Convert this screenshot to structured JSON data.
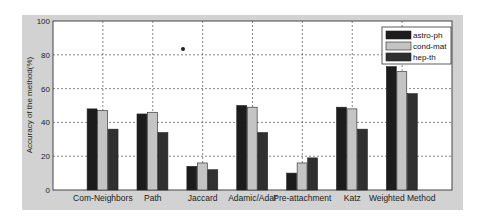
{
  "chart_data": {
    "type": "bar",
    "title": "",
    "xlabel": "",
    "ylabel": "Accuracy of the method(%)",
    "ylim": [
      0,
      100
    ],
    "yticks": [
      0,
      20,
      40,
      60,
      80,
      100
    ],
    "grid": true,
    "legend_position": "upper right",
    "categories": [
      "Com-Neighbors",
      "Path",
      "Jaccard",
      "Adamic/Adar",
      "Pre-attachment",
      "Katz",
      "Weighted Method"
    ],
    "series": [
      {
        "name": "astro-ph",
        "color": "#1c1c1c",
        "values": [
          48,
          45,
          14,
          50,
          10,
          49,
          73
        ]
      },
      {
        "name": "cond-mat",
        "color": "#c4c4c4",
        "values": [
          47,
          46,
          16,
          49,
          16,
          48,
          70
        ]
      },
      {
        "name": "hep-th",
        "color": "#303030",
        "values": [
          36,
          34,
          12,
          34,
          19,
          36,
          57
        ]
      }
    ]
  },
  "colors": {
    "frame": "#d2d2d2",
    "plot_bg": "#ffffff",
    "grid": "#555555",
    "axis": "#444444"
  }
}
